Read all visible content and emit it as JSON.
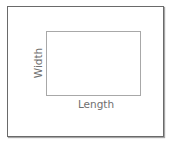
{
  "diagram": {
    "type": "rectangle-dimensions",
    "labels": {
      "length": "Length",
      "width": "Width"
    },
    "colors": {
      "outer_border": "#6a6a6a",
      "inner_border": "#a8a8a8",
      "label_text": "#707070",
      "background": "#ffffff"
    }
  }
}
